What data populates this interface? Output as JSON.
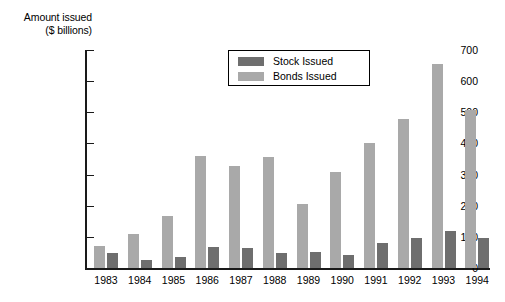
{
  "chart_data": {
    "type": "bar",
    "title": "",
    "xlabel": "",
    "ylabel": "Amount issued ($ billions)",
    "ylabel_line1": "Amount issued",
    "ylabel_line2": "($ billions)",
    "ylim": [
      0,
      700
    ],
    "ytick_values": [
      0,
      100,
      200,
      300,
      400,
      500,
      600,
      700
    ],
    "ytick_labels": [
      "0",
      "100",
      "200",
      "300",
      "400",
      "500",
      "600",
      "700"
    ],
    "grid": false,
    "legend_position": "upper center",
    "categories": [
      "1983",
      "1984",
      "1985",
      "1986",
      "1987",
      "1988",
      "1989",
      "1990",
      "1991",
      "1992",
      "1993",
      "1994"
    ],
    "series": [
      {
        "name": "Bonds Issued",
        "color": "#a9a9a9",
        "values": [
          70,
          110,
          168,
          360,
          328,
          358,
          205,
          308,
          400,
          480,
          655,
          508
        ]
      },
      {
        "name": "Stock Issued",
        "color": "#6e6e6e",
        "values": [
          48,
          25,
          35,
          68,
          65,
          48,
          52,
          43,
          80,
          95,
          120,
          95
        ]
      }
    ]
  },
  "legend": {
    "entries": [
      {
        "label": "Stock Issued",
        "swatch": "#6e6e6e"
      },
      {
        "label": "Bonds Issued",
        "swatch": "#a9a9a9"
      }
    ]
  }
}
